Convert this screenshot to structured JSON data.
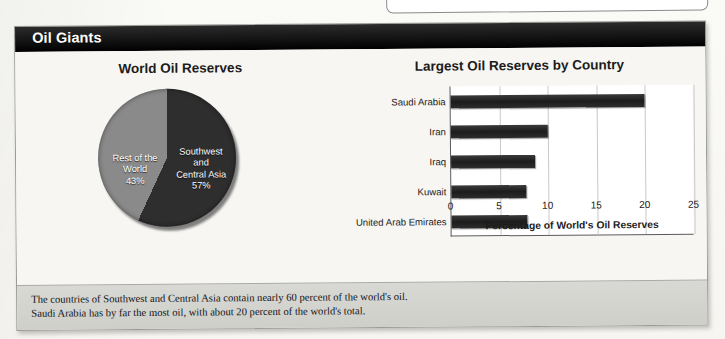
{
  "panel": {
    "header_title": "Oil Giants"
  },
  "top_box_fragment": {
    "name": "cut-off-box-above"
  },
  "caption": {
    "line1": "The countries of Southwest and Central Asia contain nearly 60 percent of the world's oil.",
    "line2": "Saudi Arabia has by far the most oil, with about 20 percent of the world's total."
  },
  "chart_data": [
    {
      "type": "pie",
      "title": "World Oil Reserves",
      "categories": [
        "Southwest and Central Asia",
        "Rest of the World"
      ],
      "values": [
        57,
        43
      ],
      "labels": [
        "Southwest\nand\nCentral Asia",
        "Rest of the\nWorld"
      ],
      "value_labels": [
        "57%",
        "43%"
      ],
      "colors": [
        "#2e2e2e",
        "#8a8a8a"
      ],
      "legend": "none"
    },
    {
      "type": "bar",
      "orientation": "horizontal",
      "title": "Largest Oil Reserves by Country",
      "categories": [
        "Saudi Arabia",
        "Iran",
        "Iraq",
        "Kuwait",
        "United Arab Emirates"
      ],
      "values": [
        20.0,
        10.0,
        8.6,
        7.7,
        7.8
      ],
      "xlabel": "Percentage of World's Oil Reserves",
      "ylabel": "",
      "xlim": [
        0,
        25
      ],
      "xticks": [
        "0",
        "5",
        "10",
        "15",
        "20",
        "25"
      ],
      "grid": true,
      "bar_color": "#222222",
      "legend": "none"
    }
  ]
}
